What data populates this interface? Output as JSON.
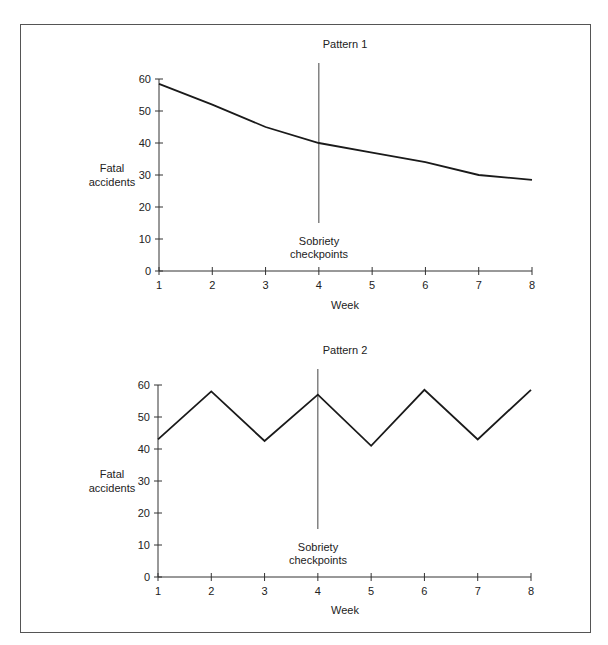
{
  "chart_data": [
    {
      "type": "line",
      "title": "Pattern 1",
      "xlabel": "Week",
      "ylabel": "Fatal accidents",
      "categories": [
        1,
        2,
        3,
        4,
        5,
        6,
        7,
        8
      ],
      "x": [
        1,
        2,
        3,
        4,
        5,
        6,
        7,
        8
      ],
      "values": [
        58.5,
        52,
        45,
        40,
        37,
        34,
        30,
        28.5
      ],
      "yticks": [
        0,
        10,
        20,
        30,
        40,
        50,
        60
      ],
      "xticks": [
        1,
        2,
        3,
        4,
        5,
        6,
        7,
        8
      ],
      "ylim": [
        0,
        60
      ],
      "xlim": [
        1,
        8
      ],
      "grid": false,
      "legend": null,
      "annotations": [
        {
          "type": "vertical-line",
          "x": 4,
          "y_range": [
            15,
            65
          ],
          "label": "Sobriety checkpoints"
        }
      ]
    },
    {
      "type": "line",
      "title": "Pattern 2",
      "xlabel": "Week",
      "ylabel": "Fatal accidents",
      "categories": [
        1,
        2,
        3,
        4,
        5,
        6,
        7,
        8
      ],
      "x": [
        1,
        2,
        3,
        4,
        5,
        6,
        7,
        8
      ],
      "values": [
        43,
        58,
        42.5,
        57,
        41,
        58.5,
        43,
        58.5
      ],
      "yticks": [
        0,
        10,
        20,
        30,
        40,
        50,
        60
      ],
      "xticks": [
        1,
        2,
        3,
        4,
        5,
        6,
        7,
        8
      ],
      "ylim": [
        0,
        60
      ],
      "xlim": [
        1,
        8
      ],
      "grid": false,
      "legend": null,
      "annotations": [
        {
          "type": "vertical-line",
          "x": 4,
          "y_range": [
            15,
            65
          ],
          "label": "Sobriety checkpoints"
        }
      ]
    }
  ],
  "charts": [
    {
      "title": "Pattern 1",
      "ylabel_line1": "Fatal",
      "ylabel_line2": "accidents",
      "xlabel": "Week",
      "annotation_line1": "Sobriety",
      "annotation_line2": "checkpoints"
    },
    {
      "title": "Pattern 2",
      "ylabel_line1": "Fatal",
      "ylabel_line2": "accidents",
      "xlabel": "Week",
      "annotation_line1": "Sobriety",
      "annotation_line2": "checkpoints"
    }
  ],
  "colors": {
    "line": "#1a1a1a",
    "axis": "#333333",
    "frame": "#555555",
    "background": "#ffffff"
  }
}
